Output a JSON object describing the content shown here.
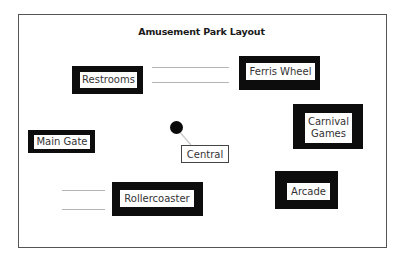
{
  "diagram": {
    "title": "Amusement Park Layout",
    "nodes": [
      {
        "id": "restrooms",
        "label": "Restrooms"
      },
      {
        "id": "ferris-wheel",
        "label": "Ferris Wheel"
      },
      {
        "id": "carnival-games",
        "label_line1": "Carnival",
        "label_line2": "Games"
      },
      {
        "id": "main-gate",
        "label": "Main Gate"
      },
      {
        "id": "central",
        "label": "Central"
      },
      {
        "id": "rollercoaster",
        "label": "Rollercoaster"
      },
      {
        "id": "arcade",
        "label": "Arcade"
      }
    ],
    "colors": {
      "box_border": "#0d0d0d",
      "box_fill": "#ffffff",
      "line": "#b5b5b5",
      "marker": "#0a0a0a"
    }
  }
}
